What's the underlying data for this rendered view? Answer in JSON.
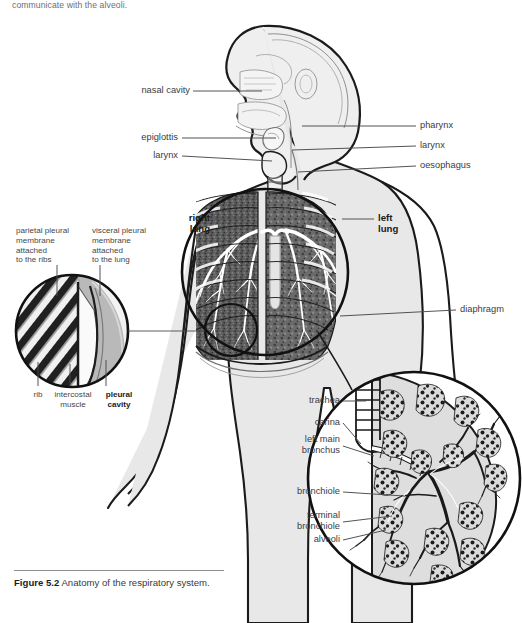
{
  "page": {
    "top_text": "communicate with the alveoli.",
    "background": "#ffffff",
    "width": 522,
    "height": 623
  },
  "figure": {
    "caption_number": "Figure 5.2",
    "caption_text": "Anatomy of the respiratory system."
  },
  "labels": {
    "nasal_cavity": "nasal cavity",
    "epiglottis": "epiglottis",
    "larynx_left": "larynx",
    "pharynx": "pharynx",
    "larynx_right": "larynx",
    "oesophagus": "oesophagus",
    "right_lung": "right\nlung",
    "left_lung": "left\nlung",
    "diaphragm": "diaphragm",
    "parietal": "parietal pleural\nmembrane\nattached\nto the ribs",
    "visceral": "visceral pleural\nmembrane\nattached\nto the lung",
    "rib": "rib",
    "intercostal": "intercostal\nmuscle",
    "pleural_cavity": "pleural\ncavity",
    "trachea": "trachea",
    "carina": "carina",
    "left_main_bronchus": "left main\nbronchus",
    "bronchiole": "bronchiole",
    "terminal_bronchiole": "terminal\nbronchiole",
    "alveoli": "alveoli"
  },
  "colors": {
    "ink": "#1b1b1b",
    "label_text": "#3c3c3e",
    "body_fill": "#e8e8e8",
    "lung_dark": "#4a4a4a",
    "lung_mid": "#6f6f6f",
    "airway_white": "#ffffff",
    "rule": "#8d8d91"
  }
}
